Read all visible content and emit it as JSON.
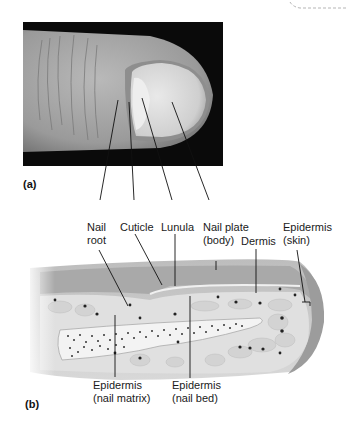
{
  "figure": {
    "panels": [
      {
        "tag": "(a)",
        "description": "photograph of fingertip showing nail"
      },
      {
        "tag": "(b)",
        "description": "sagittal section of fingertip nail structure"
      }
    ],
    "labels_top": [
      {
        "id": "nail-root",
        "line1": "Nail",
        "line2": "root"
      },
      {
        "id": "cuticle",
        "line1": "Cuticle",
        "line2": ""
      },
      {
        "id": "lunula",
        "line1": "Lunula",
        "line2": ""
      },
      {
        "id": "nail-plate",
        "line1": "Nail plate",
        "line2": "(body)"
      },
      {
        "id": "dermis",
        "line1": "Dermis",
        "line2": ""
      },
      {
        "id": "epidermis-skin",
        "line1": "Epidermis",
        "line2": "(skin)"
      }
    ],
    "labels_bottom": [
      {
        "id": "epidermis-nail-matrix",
        "line1": "Epidermis",
        "line2": "(nail matrix)"
      },
      {
        "id": "epidermis-nail-bed",
        "line1": "Epidermis",
        "line2": "(nail bed)"
      }
    ],
    "colors": {
      "photo_bg": "#0a0a0a",
      "skin_photo": "#a8a8a8",
      "nail_photo": "#d6d6d6",
      "section_outer": "#c9c9c9",
      "section_inner": "#e2e2e2",
      "bone_fill": "#f2f2f2",
      "dots": "#2a2a2a"
    }
  }
}
